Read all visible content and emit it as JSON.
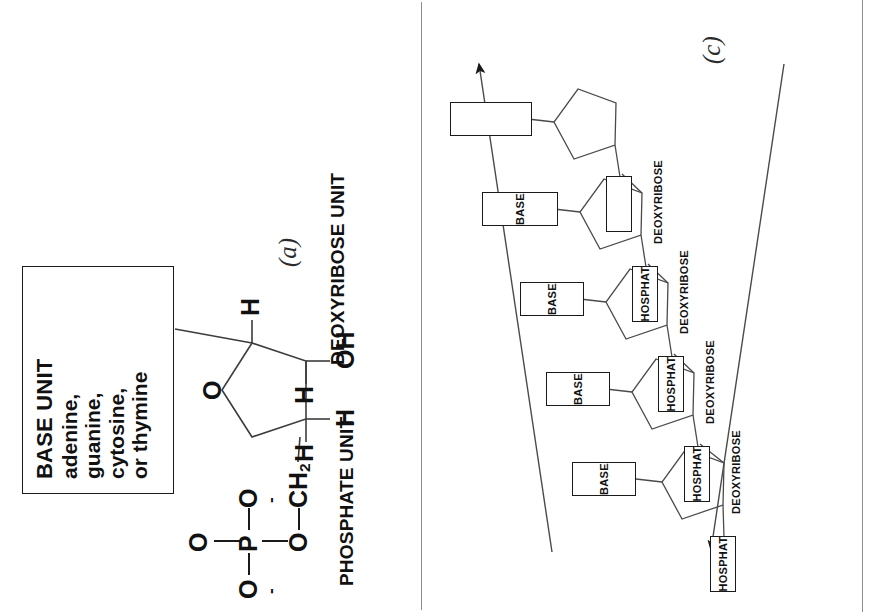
{
  "figure": {
    "panels": [
      {
        "id": "a",
        "letter": "(a)"
      },
      {
        "id": "c",
        "letter": "(c)"
      }
    ]
  },
  "panel_a": {
    "letter": "(a)",
    "base_box": {
      "title": "BASE UNIT",
      "lines": [
        "adenine,",
        "guanine,",
        "cytosine,",
        "or thymine"
      ]
    },
    "labels": {
      "phosphate": "PHOSPHATE UNIT",
      "deoxyribose": "DEOXYRIBOSE UNIT"
    },
    "atoms": {
      "p": "P",
      "o_top": "O",
      "o_left": "O",
      "o_right": "O",
      "o_bottom": "O",
      "o_ester": "O",
      "ch2": "CH",
      "ch2_sub": "2",
      "ring_o": "O",
      "h1": "H",
      "h2": "H",
      "h3": "H",
      "h4": "H",
      "h5": "H",
      "h6": "H",
      "oh": "OH",
      "minus": "-"
    }
  },
  "panel_c": {
    "letter": "(c)",
    "unit_labels": {
      "phosphate": "PHOSPHATE",
      "deoxyribose": "DEOXYRIBOSE",
      "base": "BASE"
    },
    "repeat_units": [
      {
        "phosphate": "PHOSPHATE",
        "deoxyribose": "DEOXYRIBOSE",
        "base": "BASE"
      },
      {
        "phosphate": "PHOSPHATE",
        "deoxyribose": "DEOXYRIBOSE",
        "base": "BASE"
      },
      {
        "phosphate": "PHOSPHATE",
        "deoxyribose": "DEOXYRIBOSE",
        "base": "BASE"
      },
      {
        "phosphate": "PHOSPHATE",
        "deoxyribose": "DEOXYRIBOSE",
        "base": "BASE"
      },
      {
        "phosphate": "",
        "deoxyribose": "",
        "base": ""
      },
      {
        "phosphate": "",
        "deoxyribose": "",
        "base": ""
      }
    ],
    "direction_arrows": 2
  },
  "colors": {
    "ink": "#1a1a1a",
    "line": "#4a4a4a",
    "divider": "#8d8d8d",
    "background": "#ffffff"
  }
}
